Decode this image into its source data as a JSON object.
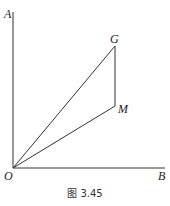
{
  "figure": {
    "caption": "图 3.45",
    "points": {
      "A": "A",
      "G": "G",
      "M": "M",
      "O": "O",
      "B": "B"
    },
    "segments": [
      "OA",
      "OB",
      "OG",
      "OM",
      "GM"
    ]
  }
}
